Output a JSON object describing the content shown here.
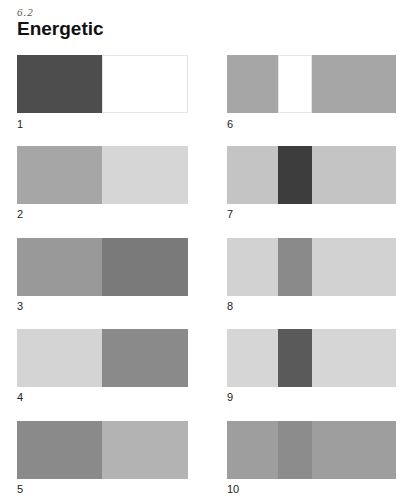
{
  "header": {
    "section_number": "6.2",
    "title": "Energetic"
  },
  "swatches": [
    {
      "label": "1",
      "layout": "split",
      "colors": [
        "#4d4d4d",
        "#ffffff"
      ]
    },
    {
      "label": "2",
      "layout": "split",
      "colors": [
        "#a6a6a6",
        "#d6d6d6"
      ]
    },
    {
      "label": "3",
      "layout": "split",
      "colors": [
        "#999999",
        "#7a7a7a"
      ]
    },
    {
      "label": "4",
      "layout": "split",
      "colors": [
        "#d4d4d4",
        "#8a8a8a"
      ]
    },
    {
      "label": "5",
      "layout": "split",
      "colors": [
        "#8a8a8a",
        "#b3b3b3"
      ]
    },
    {
      "label": "6",
      "layout": "center",
      "colors": [
        "#a6a6a6",
        "#ffffff",
        "#a6a6a6"
      ]
    },
    {
      "label": "7",
      "layout": "center",
      "colors": [
        "#c4c4c4",
        "#3d3d3d",
        "#c4c4c4"
      ]
    },
    {
      "label": "8",
      "layout": "center",
      "colors": [
        "#d2d2d2",
        "#8a8a8a",
        "#d2d2d2"
      ]
    },
    {
      "label": "9",
      "layout": "center",
      "colors": [
        "#d6d6d6",
        "#5a5a5a",
        "#d6d6d6"
      ]
    },
    {
      "label": "10",
      "layout": "center",
      "colors": [
        "#9e9e9e",
        "#8c8c8c",
        "#9e9e9e"
      ]
    }
  ]
}
